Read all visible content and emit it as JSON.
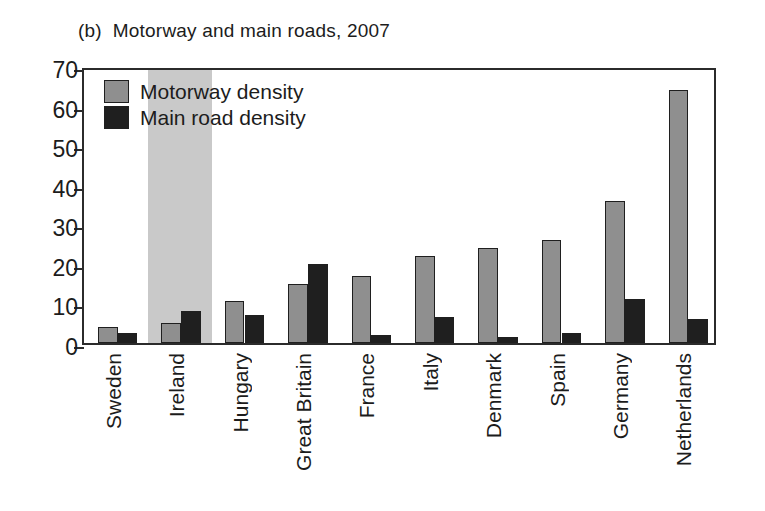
{
  "figure": {
    "panel_label": "(b)",
    "title": "Motorway and main roads, 2007"
  },
  "legend": {
    "position": "top-left-inside",
    "entries": [
      {
        "label": "Motorway density",
        "color": "#8f8f8f"
      },
      {
        "label": "Main road density",
        "color": "#1f1f1f"
      }
    ]
  },
  "axes": {
    "y_ticks": [
      "70",
      "60",
      "50",
      "40",
      "30",
      "20",
      "10",
      "0"
    ],
    "y_min": 0,
    "y_max": 70,
    "y_step": 10
  },
  "highlight": {
    "category": "Ireland",
    "color": "#c9c9c9"
  },
  "colors": {
    "motorway": "#8f8f8f",
    "main_road": "#1f1f1f",
    "axis": "#2b2b2b",
    "highlight_band": "#c9c9c9",
    "background": "#ffffff"
  },
  "chart_data": {
    "type": "bar",
    "xlabel": "",
    "ylabel": "",
    "ylim": [
      0,
      70
    ],
    "grid": false,
    "legend_position": "upper left (inside plot)",
    "categories": [
      "Sweden",
      "Ireland",
      "Hungary",
      "Great Britain",
      "France",
      "Italy",
      "Denmark",
      "Spain",
      "Germany",
      "Netherlands"
    ],
    "series": [
      {
        "name": "Motorway density",
        "color": "#8f8f8f",
        "values": [
          4,
          5,
          10.5,
          15,
          17,
          22,
          24,
          26,
          36,
          64
        ]
      },
      {
        "name": "Main road density",
        "color": "#1f1f1f",
        "values": [
          2.5,
          8,
          7,
          20,
          2,
          6.5,
          1.5,
          2.5,
          11,
          6
        ]
      }
    ],
    "annotations": [
      {
        "type": "highlight-band",
        "category": "Ireland",
        "note": "shaded vertical band behind the Ireland group"
      }
    ]
  }
}
